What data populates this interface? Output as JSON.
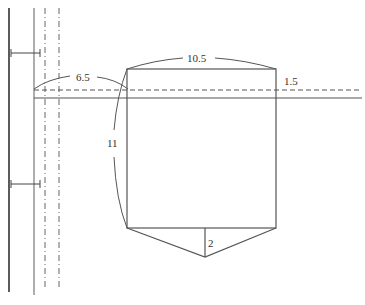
{
  "diagram": {
    "labels": {
      "offset_left": "6.5",
      "top_width": "10.5",
      "right_offset": "1.5",
      "height": "11",
      "point_depth": "2"
    },
    "colors": {
      "line": "#555555",
      "dark_line": "#333333",
      "background": "#ffffff"
    }
  }
}
